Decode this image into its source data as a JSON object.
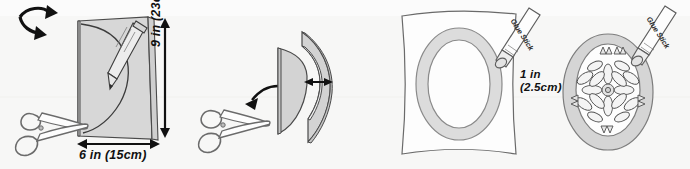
{
  "diagram": {
    "background_color": "#f7f7f6",
    "ink_color": "#3c3c3c",
    "paper_fill": "#d9d9d9",
    "paper_fill_light": "#e4e4e4",
    "paper_white": "#fdfdfd"
  },
  "steps": [
    {
      "id": "step-1",
      "name": "fold-and-draw-arc",
      "objects": [
        "folded-card",
        "pencil",
        "scissors",
        "fold-arrow"
      ],
      "labels": {
        "height": "9 in (23cm)",
        "width": "6 in (15cm)"
      }
    },
    {
      "id": "step-2",
      "name": "cut-border-strip",
      "objects": [
        "cut-arc-piece",
        "arc-frame-piece",
        "scissors",
        "open-arrow",
        "thickness-arrow"
      ],
      "labels": {
        "thickness_line1": "1 in",
        "thickness_line2": "(2.5cm)"
      }
    },
    {
      "id": "step-3",
      "name": "glue-oval-frame-to-paper",
      "objects": [
        "backing-paper",
        "oval-ring",
        "glue-stick"
      ],
      "labels": {
        "glue_stick": "Glue Stick"
      }
    },
    {
      "id": "step-4",
      "name": "glue-pressed-flowers",
      "objects": [
        "oval-ring",
        "inner-oval",
        "flower-arrangement",
        "glue-stick"
      ],
      "labels": {
        "glue_stick": "Glue Stick"
      }
    }
  ]
}
